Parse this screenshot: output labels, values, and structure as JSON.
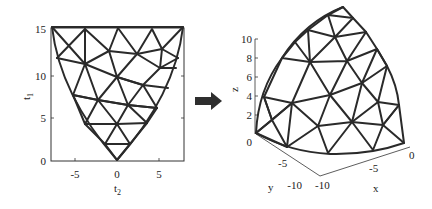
{
  "figure": {
    "left_plot": {
      "title": "",
      "xlabel": "t",
      "xlabel_sub": "2",
      "ylabel": "t",
      "ylabel_sub": "1",
      "xticks": [
        "-5",
        "0",
        "5"
      ],
      "yticks": [
        "0",
        "5",
        "10",
        "15"
      ],
      "xlim": [
        -8,
        8
      ],
      "ylim": [
        0,
        16
      ],
      "description": "2D triangulated parameter domain (inverted triangle with curved sides)"
    },
    "arrow": {
      "label": "",
      "direction": "right",
      "icon": "right-arrow-icon"
    },
    "right_plot": {
      "zlabel": "z",
      "xlabel": "x",
      "ylabel": "y",
      "zticks": [
        "0",
        "2",
        "4",
        "6",
        "8",
        "10"
      ],
      "xticks": [
        "-10",
        "-5",
        "0"
      ],
      "yticks": [
        "-10",
        "-5"
      ],
      "description": "3D triangulated surface mapped from parameter domain"
    }
  },
  "colors": {
    "mesh": "#2a2a2a",
    "background": "#ffffff",
    "arrow": "#2e2e2e"
  }
}
